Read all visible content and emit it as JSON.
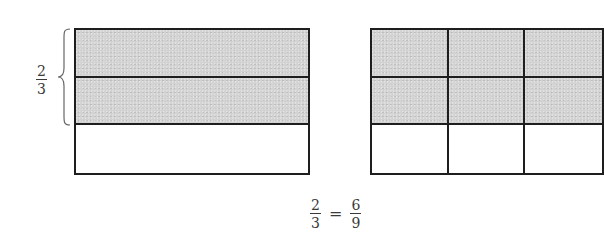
{
  "diagram": {
    "left_model": {
      "rows": 3,
      "columns": 1,
      "shaded_rows": 2,
      "brace_label": {
        "numerator": "2",
        "denominator": "3"
      }
    },
    "right_model": {
      "rows": 3,
      "columns": 3,
      "shaded_rows": 2
    },
    "equation": {
      "left": {
        "numerator": "2",
        "denominator": "3"
      },
      "operator": "=",
      "right": {
        "numerator": "6",
        "denominator": "9"
      }
    },
    "colors": {
      "shaded": "#d2d2d2",
      "unshaded": "#ffffff",
      "line": "#1e1e1e",
      "text": "#3a3a3a"
    }
  }
}
